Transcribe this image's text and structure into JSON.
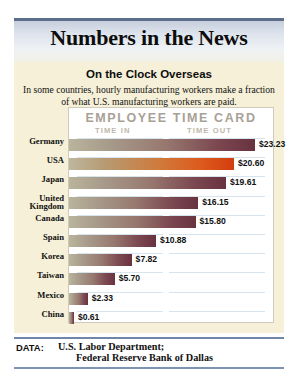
{
  "header": {
    "title": "Numbers in the News"
  },
  "subtitle": "On the Clock Overseas",
  "deck": "In some countries, hourly manufacturing workers make a fraction of what U.S. manufacturing workers are paid.",
  "card": {
    "title": "EMPLOYEE TIME CARD",
    "time_in_label": "TIME IN",
    "time_out_label": "TIME OUT"
  },
  "footer": {
    "data_label": "DATA:",
    "source_line1": "U.S. Labor Department;",
    "source_line2": "Federal Reserve Bank of Dallas"
  },
  "colors": {
    "title_band": "#5d6e8c",
    "cream_bg": "#f6f0d8",
    "bar_dark": "#68323f",
    "bar_highlight": "#d33d0d",
    "rule_blue": "#d7e4ee",
    "footer_rule": "#6f86a8"
  },
  "chart_data": {
    "type": "bar",
    "title": "On the Clock Overseas",
    "subtitle": "EMPLOYEE TIME CARD",
    "xlabel": "",
    "ylabel": "",
    "orientation": "horizontal",
    "value_prefix": "$",
    "xlim": [
      0,
      23.23
    ],
    "grid": false,
    "legend": null,
    "categories": [
      "Germany",
      "USA",
      "Japan",
      "United Kingdom",
      "Canada",
      "Spain",
      "Korea",
      "Taiwan",
      "Mexico",
      "China"
    ],
    "values": [
      23.23,
      20.6,
      19.61,
      16.15,
      15.8,
      10.88,
      7.82,
      5.7,
      2.33,
      0.61
    ],
    "highlight_category": "USA",
    "rows": [
      {
        "label": "Germany",
        "label2": "",
        "value": 23.23,
        "display": "$23.23",
        "highlight": false
      },
      {
        "label": "USA",
        "label2": "",
        "value": 20.6,
        "display": "$20.60",
        "highlight": true
      },
      {
        "label": "Japan",
        "label2": "",
        "value": 19.61,
        "display": "$19.61",
        "highlight": false
      },
      {
        "label": "United",
        "label2": "Kingdom",
        "value": 16.15,
        "display": "$16.15",
        "highlight": false
      },
      {
        "label": "Canada",
        "label2": "",
        "value": 15.8,
        "display": "$15.80",
        "highlight": false
      },
      {
        "label": "Spain",
        "label2": "",
        "value": 10.88,
        "display": "$10.88",
        "highlight": false
      },
      {
        "label": "Korea",
        "label2": "",
        "value": 7.82,
        "display": "$7.82",
        "highlight": false
      },
      {
        "label": "Taiwan",
        "label2": "",
        "value": 5.7,
        "display": "$5.70",
        "highlight": false
      },
      {
        "label": "Mexico",
        "label2": "",
        "value": 2.33,
        "display": "$2.33",
        "highlight": false
      },
      {
        "label": "China",
        "label2": "",
        "value": 0.61,
        "display": "$0.61",
        "highlight": false
      }
    ]
  }
}
